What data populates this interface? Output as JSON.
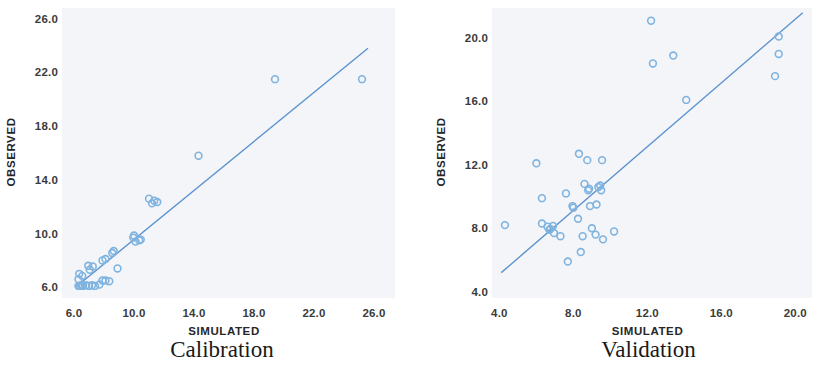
{
  "figure": {
    "panel_count": 2,
    "marker_color": "#7fb3e0",
    "line_color": "#5b92d0",
    "plot_background": "#f4f5f8",
    "text_color": "#3b3b3b"
  },
  "chart_data": [
    {
      "type": "scatter",
      "title": "Calibration",
      "xlabel": "SIMULATED",
      "ylabel": "OBSERVED",
      "xlim": [
        5.2,
        27.4
      ],
      "ylim": [
        5.2,
        26.8
      ],
      "xticks": [
        "6.0",
        "10.0",
        "14.0",
        "18.0",
        "22.0",
        "26.0"
      ],
      "xtick_values": [
        6.0,
        10.0,
        14.0,
        18.0,
        22.0,
        26.0
      ],
      "yticks": [
        "6.0",
        "10.0",
        "14.0",
        "18.0",
        "22.0",
        "26.0"
      ],
      "ytick_values": [
        6.0,
        10.0,
        14.0,
        18.0,
        22.0,
        26.0
      ],
      "grid": false,
      "legend": "none",
      "marker": "open-circle",
      "fit_line": {
        "label": "1:1 regression line",
        "x_start": 6.1,
        "y_start": 6.0,
        "x_end": 25.6,
        "y_end": 23.8
      },
      "points": [
        {
          "x": 6.3,
          "y": 6.1
        },
        {
          "x": 6.4,
          "y": 6.1
        },
        {
          "x": 6.5,
          "y": 6.15
        },
        {
          "x": 6.6,
          "y": 6.1
        },
        {
          "x": 6.8,
          "y": 6.15
        },
        {
          "x": 7.0,
          "y": 6.1
        },
        {
          "x": 7.2,
          "y": 6.15
        },
        {
          "x": 7.4,
          "y": 6.1
        },
        {
          "x": 7.7,
          "y": 6.2
        },
        {
          "x": 7.9,
          "y": 6.5
        },
        {
          "x": 8.1,
          "y": 6.5
        },
        {
          "x": 8.35,
          "y": 6.45
        },
        {
          "x": 6.3,
          "y": 6.6
        },
        {
          "x": 6.35,
          "y": 7.0
        },
        {
          "x": 6.55,
          "y": 6.85
        },
        {
          "x": 6.95,
          "y": 7.6
        },
        {
          "x": 7.05,
          "y": 7.3
        },
        {
          "x": 7.25,
          "y": 7.55
        },
        {
          "x": 7.9,
          "y": 8.0
        },
        {
          "x": 8.1,
          "y": 8.1
        },
        {
          "x": 8.55,
          "y": 8.55
        },
        {
          "x": 8.65,
          "y": 8.7
        },
        {
          "x": 8.9,
          "y": 7.4
        },
        {
          "x": 9.95,
          "y": 9.7
        },
        {
          "x": 10.0,
          "y": 9.85
        },
        {
          "x": 10.1,
          "y": 9.4
        },
        {
          "x": 10.35,
          "y": 9.5
        },
        {
          "x": 10.45,
          "y": 9.55
        },
        {
          "x": 11.0,
          "y": 12.6
        },
        {
          "x": 11.2,
          "y": 12.25
        },
        {
          "x": 11.35,
          "y": 12.45
        },
        {
          "x": 11.55,
          "y": 12.35
        },
        {
          "x": 14.3,
          "y": 15.8
        },
        {
          "x": 19.4,
          "y": 21.5
        },
        {
          "x": 25.2,
          "y": 21.5
        }
      ]
    },
    {
      "type": "scatter",
      "title": "Validation",
      "xlabel": "SIMULATED",
      "ylabel": "OBSERVED",
      "xlim": [
        3.6,
        20.9
      ],
      "ylim": [
        3.6,
        21.9
      ],
      "xticks": [
        "4.0",
        "8.0",
        "12.0",
        "16.0",
        "20.0"
      ],
      "xtick_values": [
        4.0,
        8.0,
        12.0,
        16.0,
        20.0
      ],
      "yticks": [
        "4.0",
        "8.0",
        "12.0",
        "16.0",
        "20.0"
      ],
      "ytick_values": [
        4.0,
        8.0,
        12.0,
        16.0,
        20.0
      ],
      "grid": false,
      "legend": "none",
      "marker": "open-circle",
      "fit_line": {
        "label": "1:1 regression line",
        "x_start": 4.1,
        "y_start": 5.2,
        "x_end": 20.4,
        "y_end": 21.6
      },
      "points": [
        {
          "x": 4.3,
          "y": 8.2
        },
        {
          "x": 6.0,
          "y": 12.1
        },
        {
          "x": 6.3,
          "y": 9.9
        },
        {
          "x": 6.3,
          "y": 8.3
        },
        {
          "x": 6.6,
          "y": 8.1
        },
        {
          "x": 6.7,
          "y": 7.9
        },
        {
          "x": 6.75,
          "y": 7.95
        },
        {
          "x": 6.9,
          "y": 8.15
        },
        {
          "x": 6.95,
          "y": 7.7
        },
        {
          "x": 7.3,
          "y": 7.5
        },
        {
          "x": 7.6,
          "y": 10.2
        },
        {
          "x": 7.7,
          "y": 5.9
        },
        {
          "x": 7.95,
          "y": 9.4
        },
        {
          "x": 8.0,
          "y": 9.3
        },
        {
          "x": 8.25,
          "y": 8.6
        },
        {
          "x": 8.3,
          "y": 12.7
        },
        {
          "x": 8.4,
          "y": 6.5
        },
        {
          "x": 8.5,
          "y": 7.5
        },
        {
          "x": 8.6,
          "y": 10.8
        },
        {
          "x": 8.75,
          "y": 12.3
        },
        {
          "x": 8.8,
          "y": 10.4
        },
        {
          "x": 8.85,
          "y": 10.5
        },
        {
          "x": 8.9,
          "y": 9.4
        },
        {
          "x": 9.0,
          "y": 8.0
        },
        {
          "x": 9.2,
          "y": 7.6
        },
        {
          "x": 9.25,
          "y": 9.5
        },
        {
          "x": 9.35,
          "y": 10.6
        },
        {
          "x": 9.45,
          "y": 10.7
        },
        {
          "x": 9.5,
          "y": 10.4
        },
        {
          "x": 9.55,
          "y": 12.3
        },
        {
          "x": 9.6,
          "y": 7.3
        },
        {
          "x": 10.2,
          "y": 7.8
        },
        {
          "x": 12.2,
          "y": 21.1
        },
        {
          "x": 12.3,
          "y": 18.4
        },
        {
          "x": 13.4,
          "y": 18.9
        },
        {
          "x": 14.1,
          "y": 16.1
        },
        {
          "x": 19.1,
          "y": 20.1
        },
        {
          "x": 19.1,
          "y": 19.0
        },
        {
          "x": 18.9,
          "y": 17.6
        }
      ]
    }
  ]
}
